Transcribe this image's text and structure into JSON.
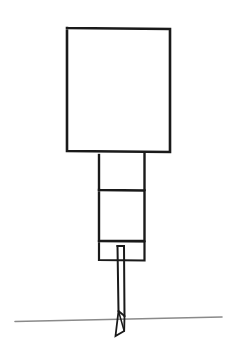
{
  "figure": {
    "background_color": "#ffffff",
    "canvas": {
      "width": 244,
      "height": 356
    },
    "stroke_color": "#1a1a1a",
    "ground_color": "#8a8a8a"
  },
  "shapes": {
    "head_panel": {
      "name": "Large square panel (head)",
      "x": 67,
      "y": 27,
      "width": 103,
      "height": 125,
      "stroke_width": 2.6,
      "fill": "none",
      "points": "67,28 170,29 170,152 67,151 67,28"
    },
    "upper_shaft": {
      "name": "Upper open shaft segment (two vertical rails)",
      "left_rail": "99,155 99,190",
      "right_rail": "144.5,154 144.5,190",
      "stroke_width": 2.4
    },
    "mid_box": {
      "name": "Middle rectangular segment",
      "x": 99,
      "y": 190,
      "width": 45,
      "height": 51,
      "stroke_width": 2.4,
      "points": "99,190 144.5,190.5 144.5,241 99,241 99,190"
    },
    "lower_box": {
      "name": "Lower small collar box",
      "x": 99,
      "y": 241,
      "width": 45,
      "height": 19,
      "stroke_width": 2.2,
      "points": "99,241 144.5,241.5 144.5,260.5 99,260 99,241"
    },
    "needle_shaft": {
      "name": "Narrow needle shaft",
      "top_y": 246,
      "bottom_y": 315,
      "left_x": 117.5,
      "right_x": 124,
      "stroke_width": 2.0,
      "left_edge": "117.5,246 118.5,311",
      "right_edge": "124,246 124.5,316",
      "cap": "117.5,246 124,246"
    },
    "needle_tip": {
      "name": "Pointed bevelled tip crossing the ground",
      "stroke_width": 1.8,
      "outline": "118.5,311 124.5,316 124.2,331 115.5,336 118.5,311",
      "bevel": "118.5,311 124.2,331"
    },
    "ground_line": {
      "name": "Ground / horizon line",
      "x1": 15,
      "y1": 321.5,
      "x2": 222,
      "y2": 317,
      "stroke_width": 1.6,
      "color": "#8a8a8a"
    }
  }
}
